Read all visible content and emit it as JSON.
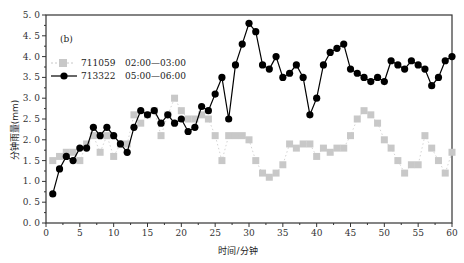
{
  "chart_data": {
    "type": "line",
    "panel_label": "(b)",
    "title": "",
    "xlabel": "时间/分钟",
    "ylabel": "分钟雨量(mm)",
    "xlim": [
      0,
      60
    ],
    "ylim": [
      0,
      5.0
    ],
    "xticks": [
      0,
      5,
      10,
      15,
      20,
      25,
      30,
      35,
      40,
      45,
      50,
      55,
      60
    ],
    "yticks": [
      "0.0",
      "0.5",
      "1.0",
      "1.5",
      "2.0",
      "2.5",
      "3.0",
      "3.5",
      "4.0",
      "4.5",
      "5.0"
    ],
    "grid": false,
    "legend_position": "upper-left",
    "x": [
      1,
      2,
      3,
      4,
      5,
      6,
      7,
      8,
      9,
      10,
      11,
      12,
      13,
      14,
      15,
      16,
      17,
      18,
      19,
      20,
      21,
      22,
      23,
      24,
      25,
      26,
      27,
      28,
      29,
      30,
      31,
      32,
      33,
      34,
      35,
      36,
      37,
      38,
      39,
      40,
      41,
      42,
      43,
      44,
      45,
      46,
      47,
      48,
      49,
      50,
      51,
      52,
      53,
      54,
      55,
      56,
      57,
      58,
      59,
      60
    ],
    "series": [
      {
        "name": "711059",
        "period": "02:00—03:00",
        "color": "#c8c8c8",
        "marker": "square",
        "line": "dotted",
        "values": [
          1.5,
          1.6,
          1.7,
          1.7,
          1.5,
          1.9,
          2.1,
          1.7,
          2.1,
          1.6,
          1.9,
          1.9,
          2.6,
          2.4,
          2.6,
          2.7,
          2.1,
          2.6,
          3.0,
          2.7,
          2.5,
          2.5,
          2.6,
          2.5,
          2.1,
          1.5,
          2.1,
          2.1,
          2.1,
          2.0,
          1.5,
          1.2,
          1.1,
          1.2,
          1.4,
          1.9,
          1.8,
          1.9,
          1.9,
          1.6,
          1.8,
          1.7,
          1.8,
          1.8,
          2.1,
          2.5,
          2.7,
          2.6,
          2.4,
          2.0,
          1.8,
          1.5,
          1.2,
          1.4,
          1.4,
          2.1,
          1.8,
          1.5,
          1.2,
          1.7
        ]
      },
      {
        "name": "713322",
        "period": "05:00—06:00",
        "color": "#000000",
        "marker": "circle",
        "line": "solid",
        "values": [
          0.7,
          1.3,
          1.6,
          1.5,
          1.8,
          1.8,
          2.3,
          2.1,
          2.3,
          2.1,
          1.9,
          1.7,
          2.3,
          2.7,
          2.6,
          2.7,
          2.4,
          2.6,
          2.4,
          2.5,
          2.2,
          2.3,
          2.8,
          2.7,
          3.1,
          3.5,
          2.5,
          3.8,
          4.3,
          4.8,
          4.6,
          3.8,
          3.7,
          4.0,
          3.5,
          3.6,
          3.8,
          3.5,
          2.6,
          3.0,
          3.8,
          4.1,
          4.2,
          4.3,
          3.7,
          3.6,
          3.5,
          3.4,
          3.5,
          3.4,
          3.9,
          3.8,
          3.7,
          3.9,
          3.8,
          3.7,
          3.3,
          3.5,
          3.9,
          4.0
        ]
      }
    ]
  }
}
